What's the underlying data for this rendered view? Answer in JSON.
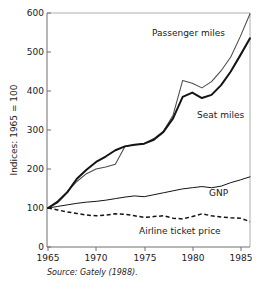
{
  "chart_data": {
    "type": "line",
    "title": "",
    "xlabel": "",
    "ylabel": "Indices: 1965 = 100",
    "xlim": [
      1965,
      1986
    ],
    "ylim": [
      0,
      600
    ],
    "grid": false,
    "legend_position": "inline-annotations",
    "x_ticks": [
      1965,
      1970,
      1975,
      1980,
      1985
    ],
    "y_ticks": [
      0,
      100,
      200,
      300,
      400,
      500,
      600
    ],
    "x": [
      1965,
      1966,
      1967,
      1968,
      1969,
      1970,
      1971,
      1972,
      1973,
      1974,
      1975,
      1976,
      1977,
      1978,
      1979,
      1980,
      1981,
      1982,
      1983,
      1984,
      1985,
      1986
    ],
    "series": [
      {
        "name": "Passenger miles",
        "style": "solid-thin",
        "color": "#4a4a4a",
        "values": [
          100,
          118,
          142,
          168,
          188,
          200,
          205,
          212,
          258,
          262,
          265,
          278,
          297,
          338,
          427,
          420,
          408,
          424,
          452,
          487,
          540,
          598
        ]
      },
      {
        "name": "Seat miles",
        "style": "solid-thick",
        "color": "#141414",
        "values": [
          100,
          115,
          140,
          175,
          198,
          218,
          232,
          248,
          258,
          262,
          265,
          275,
          295,
          330,
          385,
          396,
          382,
          390,
          415,
          450,
          492,
          535
        ]
      },
      {
        "name": "GNP",
        "style": "solid-thin",
        "color": "#141414",
        "values": [
          100,
          104,
          108,
          112,
          115,
          117,
          120,
          124,
          128,
          131,
          129,
          134,
          139,
          144,
          149,
          152,
          155,
          152,
          156,
          165,
          172,
          180
        ]
      },
      {
        "name": "Airline ticket price",
        "style": "dashed",
        "color": "#141414",
        "values": [
          100,
          95,
          90,
          86,
          82,
          80,
          82,
          85,
          84,
          80,
          76,
          78,
          80,
          74,
          72,
          78,
          85,
          80,
          77,
          75,
          74,
          65
        ]
      }
    ],
    "annotations": [
      {
        "text": "Passenger miles",
        "x": 1978.0,
        "y": 540
      },
      {
        "text": "Seat miles",
        "x": 1980.4,
        "y": 330
      },
      {
        "text": "GNP",
        "x": 1981.6,
        "y": 152
      },
      {
        "text": "Airline ticket price",
        "x": 1975.2,
        "y": 42
      }
    ],
    "source_note": "Source: Gately (1988)."
  },
  "axis": {
    "y_title": "Indices: 1965 = 100",
    "y_tick_labels": [
      "600",
      "500",
      "400",
      "300",
      "200",
      "100",
      "0"
    ],
    "x_tick_labels": [
      "1965",
      "1970",
      "1975",
      "1980",
      "1985"
    ]
  },
  "labels": {
    "passenger_miles": "Passenger miles",
    "seat_miles": "Seat miles",
    "gnp": "GNP",
    "airline_ticket_price": "Airline ticket price"
  },
  "footer": {
    "source": "Source: Gately (1988)."
  }
}
